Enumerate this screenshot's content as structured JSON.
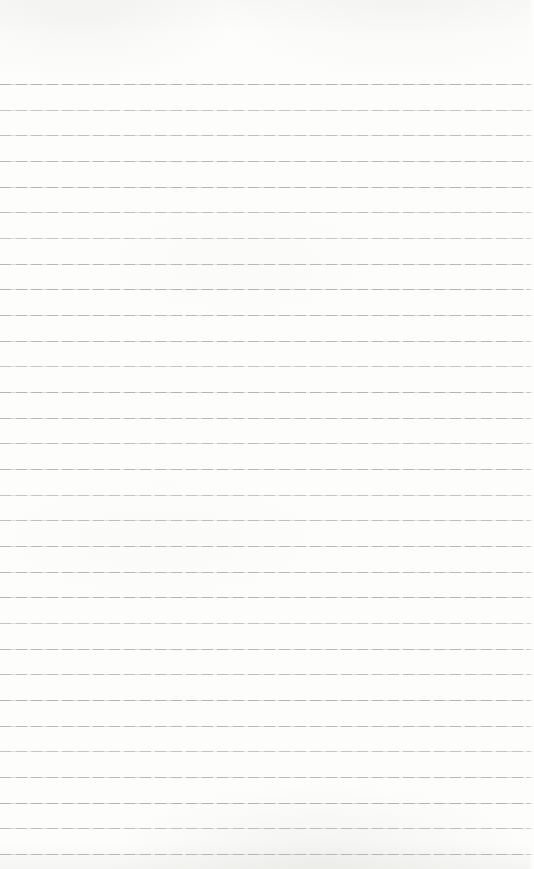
{
  "page": {
    "kind": "blank-lined-notebook-page",
    "paper_color": "#fdfdfc",
    "line_color": "#a8a8a6",
    "width_px": 534,
    "height_px": 869,
    "ruled_lines": {
      "count": 31,
      "first_line_top_px": 84,
      "spacing_px": 25.67
    }
  }
}
